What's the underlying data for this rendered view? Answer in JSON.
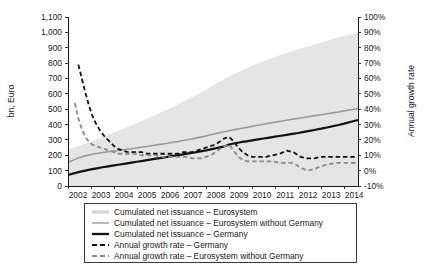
{
  "chart_data": {
    "type": "line",
    "title": "",
    "xlabel": "",
    "ylabel": "bn, Euro",
    "y2label": "Annual growth rate",
    "grid": false,
    "legend_position": "bottom",
    "x_tick_labels": [
      "2002",
      "2003",
      "2004",
      "2005",
      "2006",
      "2007",
      "2008",
      "2009",
      "2010",
      "2011",
      "2012",
      "2013",
      "2014"
    ],
    "y_tick_labels": [
      "0",
      "100",
      "200",
      "300",
      "400",
      "500",
      "600",
      "700",
      "800",
      "900",
      "1,000",
      "1,100"
    ],
    "y2_tick_labels": [
      "-10%",
      "0%",
      "10%",
      "20%",
      "30%",
      "40%",
      "50%",
      "60%",
      "70%",
      "80%",
      "90%",
      "100%"
    ],
    "ylim": [
      0,
      1100
    ],
    "y2lim": [
      -10,
      100
    ],
    "xlim": [
      2002.0,
      2014.6
    ],
    "series": [
      {
        "name": "Cumulated net issuance – Eurosystem",
        "axis": "left",
        "style": "band",
        "color": "#e2e2e2",
        "x": [
          2002.0,
          2002.5,
          2003.0,
          2003.5,
          2004.0,
          2004.5,
          2005.0,
          2005.5,
          2006.0,
          2006.5,
          2007.0,
          2007.5,
          2008.0,
          2008.5,
          2009.0,
          2009.5,
          2010.0,
          2010.5,
          2011.0,
          2011.5,
          2012.0,
          2012.5,
          2013.0,
          2013.5,
          2014.0,
          2014.6
        ],
        "values": [
          238,
          262,
          290,
          318,
          348,
          378,
          410,
          442,
          476,
          510,
          548,
          586,
          628,
          672,
          712,
          748,
          782,
          812,
          840,
          866,
          890,
          912,
          934,
          956,
          978,
          996
        ]
      },
      {
        "name": "Cumulated net issuance – Eurosystem without Germany",
        "axis": "left",
        "style": "solid",
        "color": "#9a9a9a",
        "width": 1.6,
        "x": [
          2002.0,
          2002.25,
          2002.5,
          2002.75,
          2003.0,
          2003.25,
          2003.5,
          2003.75,
          2004.0,
          2004.25,
          2004.5,
          2004.75,
          2005.0,
          2005.25,
          2005.5,
          2005.75,
          2006.0,
          2006.25,
          2006.5,
          2006.75,
          2007.0,
          2007.25,
          2007.5,
          2007.75,
          2008.0,
          2008.25,
          2008.5,
          2008.75,
          2009.0,
          2009.25,
          2009.5,
          2009.75,
          2010.0,
          2010.25,
          2010.5,
          2010.75,
          2011.0,
          2011.25,
          2011.5,
          2011.75,
          2012.0,
          2012.25,
          2012.5,
          2012.75,
          2013.0,
          2013.25,
          2013.5,
          2013.75,
          2014.0,
          2014.3,
          2014.6
        ],
        "values": [
          155,
          170,
          185,
          196,
          205,
          212,
          218,
          223,
          228,
          233,
          238,
          243,
          249,
          254,
          259,
          265,
          271,
          277,
          283,
          289,
          296,
          303,
          310,
          318,
          326,
          335,
          344,
          352,
          360,
          367,
          374,
          381,
          388,
          395,
          402,
          409,
          416,
          422,
          428,
          434,
          440,
          446,
          452,
          458,
          464,
          470,
          476,
          482,
          489,
          496,
          503
        ]
      },
      {
        "name": "Cumulated net issuance – Germany",
        "axis": "left",
        "style": "solid",
        "color": "#111111",
        "width": 2.2,
        "x": [
          2002.0,
          2002.25,
          2002.5,
          2002.75,
          2003.0,
          2003.25,
          2003.5,
          2003.75,
          2004.0,
          2004.25,
          2004.5,
          2004.75,
          2005.0,
          2005.25,
          2005.5,
          2005.75,
          2006.0,
          2006.25,
          2006.5,
          2006.75,
          2007.0,
          2007.25,
          2007.5,
          2007.75,
          2008.0,
          2008.25,
          2008.5,
          2008.75,
          2009.0,
          2009.25,
          2009.5,
          2009.75,
          2010.0,
          2010.25,
          2010.5,
          2010.75,
          2011.0,
          2011.25,
          2011.5,
          2011.75,
          2012.0,
          2012.25,
          2012.5,
          2012.75,
          2013.0,
          2013.25,
          2013.5,
          2013.75,
          2014.0,
          2014.3,
          2014.6
        ],
        "values": [
          72,
          82,
          92,
          100,
          108,
          115,
          122,
          128,
          134,
          140,
          146,
          152,
          158,
          164,
          170,
          176,
          182,
          188,
          194,
          200,
          206,
          212,
          218,
          225,
          232,
          240,
          248,
          256,
          270,
          278,
          285,
          291,
          297,
          303,
          309,
          315,
          321,
          327,
          333,
          339,
          345,
          352,
          359,
          366,
          373,
          381,
          389,
          397,
          406,
          418,
          430
        ]
      },
      {
        "name": "Annual growth rate – Germany",
        "axis": "right",
        "style": "dashed",
        "color": "#111111",
        "width": 1.8,
        "x": [
          2002.45,
          2002.6,
          2002.75,
          2002.9,
          2003.05,
          2003.2,
          2003.4,
          2003.6,
          2003.8,
          2004.0,
          2004.2,
          2004.4,
          2004.6,
          2004.8,
          2005.0,
          2005.2,
          2005.4,
          2005.6,
          2005.8,
          2006.0,
          2006.2,
          2006.4,
          2006.6,
          2006.8,
          2007.0,
          2007.2,
          2007.4,
          2007.6,
          2007.8,
          2008.0,
          2008.2,
          2008.4,
          2008.6,
          2008.8,
          2009.0,
          2009.2,
          2009.4,
          2009.6,
          2009.8,
          2010.0,
          2010.3,
          2010.6,
          2010.9,
          2011.2,
          2011.5,
          2011.8,
          2012.1,
          2012.4,
          2012.7,
          2013.0,
          2013.3,
          2013.6,
          2013.9,
          2014.2,
          2014.5
        ],
        "values": [
          69,
          60,
          51,
          43,
          36,
          31,
          26,
          22,
          19,
          16,
          14,
          13,
          12,
          12,
          12,
          12,
          11,
          11,
          11,
          11,
          11,
          11,
          11,
          11,
          12,
          12,
          12,
          13,
          14,
          15,
          16,
          17,
          19,
          21,
          22,
          19,
          15,
          12,
          10,
          9,
          9,
          9,
          10,
          11,
          13,
          12,
          9,
          8,
          8,
          9,
          9,
          9,
          9,
          9,
          9
        ]
      },
      {
        "name": "Annual growth rate – Eurosystem without Germany",
        "axis": "right",
        "style": "dashed",
        "color": "#8a8a8a",
        "width": 1.8,
        "x": [
          2002.3,
          2002.45,
          2002.6,
          2002.75,
          2002.9,
          2003.05,
          2003.2,
          2003.4,
          2003.6,
          2003.8,
          2004.0,
          2004.2,
          2004.4,
          2004.6,
          2004.8,
          2005.0,
          2005.2,
          2005.4,
          2005.6,
          2005.8,
          2006.0,
          2006.2,
          2006.4,
          2006.6,
          2006.8,
          2007.0,
          2007.2,
          2007.4,
          2007.6,
          2007.8,
          2008.0,
          2008.2,
          2008.4,
          2008.6,
          2008.8,
          2009.0,
          2009.2,
          2009.4,
          2009.6,
          2009.8,
          2010.0,
          2010.3,
          2010.6,
          2010.9,
          2011.2,
          2011.5,
          2011.8,
          2012.1,
          2012.4,
          2012.7,
          2013.0,
          2013.3,
          2013.6,
          2013.9,
          2014.2,
          2014.5
        ],
        "values": [
          44,
          34,
          27,
          22,
          19,
          17,
          16,
          15,
          14,
          13,
          12,
          11,
          11,
          11,
          11,
          11,
          10,
          10,
          10,
          10,
          9,
          9,
          9,
          9,
          9,
          9,
          9,
          8,
          8,
          8,
          9,
          10,
          12,
          14,
          16,
          17,
          13,
          9,
          7,
          6,
          6,
          6,
          6,
          6,
          5,
          5,
          5,
          2,
          0,
          1,
          3,
          4,
          5,
          5,
          5,
          5
        ]
      }
    ]
  },
  "legend": {
    "items": [
      {
        "label": "Cumulated net issuance – Eurosystem",
        "swatch": "light-gray-thick",
        "color": "#d6d6d6"
      },
      {
        "label": "Cumulated net issuance – Eurosystem without Germany",
        "swatch": "gray-thin",
        "color": "#9a9a9a"
      },
      {
        "label": "Cumulated net issuance – Germany",
        "swatch": "black-thick",
        "color": "#111111"
      },
      {
        "label": "Annual growth rate – Germany",
        "swatch": "black-dashed",
        "color": "#111111"
      },
      {
        "label": "Annual growth rate – Eurosystem without Germany",
        "swatch": "gray-dashed",
        "color": "#8a8a8a"
      }
    ]
  }
}
